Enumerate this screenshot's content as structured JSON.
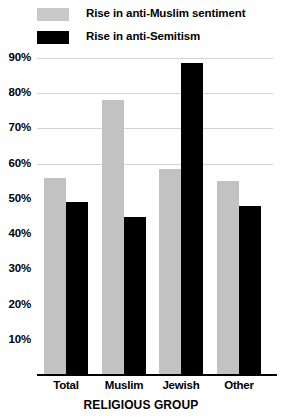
{
  "chart_data": {
    "type": "bar",
    "title": "",
    "xlabel": "RELIGIOUS GROUP",
    "ylabel": "",
    "categories": [
      "Total",
      "Muslim",
      "Jewish",
      "Other"
    ],
    "series": [
      {
        "name": "Rise in anti-Muslim sentiment",
        "color": "#c2c2c2",
        "values": [
          56,
          78,
          58.5,
          55
        ]
      },
      {
        "name": "Rise in anti-Semitism",
        "color": "#000000",
        "values": [
          49,
          45,
          88.5,
          48
        ]
      }
    ],
    "ylim": [
      0,
      92
    ],
    "yticks": [
      90,
      80,
      70,
      60,
      50,
      40,
      30,
      20,
      10
    ],
    "ytick_labels": [
      "90%",
      "80%",
      "70%",
      "60%",
      "50%",
      "40%",
      "30%",
      "20%",
      "10%"
    ],
    "grid": true,
    "grid_visible_above": 60,
    "legend_position": "top-left"
  },
  "legend": {
    "items": [
      {
        "label": "Rise in anti-Muslim sentiment",
        "swatch": "gray"
      },
      {
        "label": "Rise in anti-Semitism",
        "swatch": "black"
      }
    ]
  }
}
